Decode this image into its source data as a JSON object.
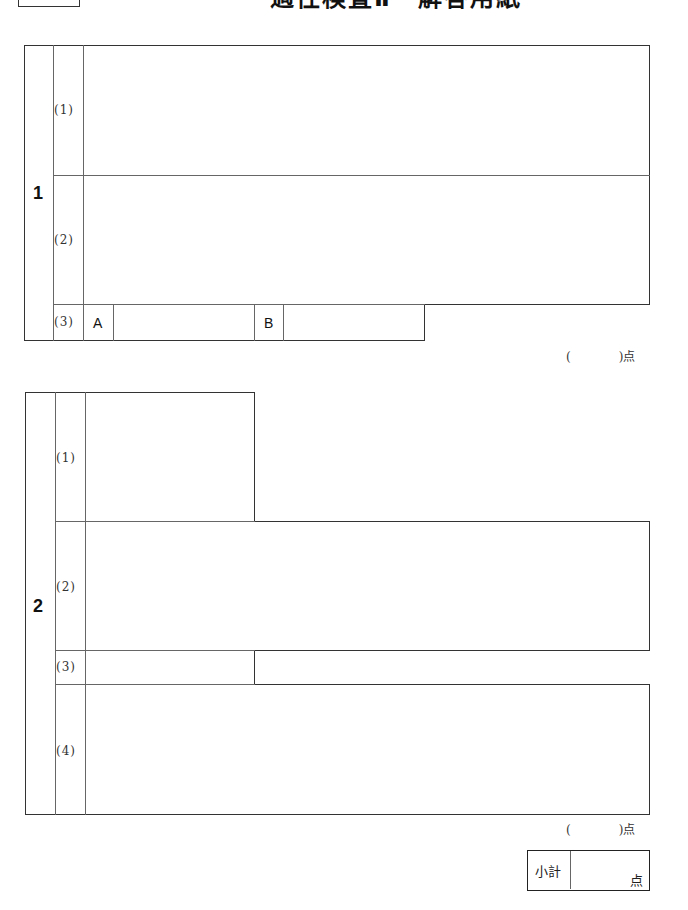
{
  "header": {
    "title": "適性検査Ⅱ　解答用紙"
  },
  "sections": [
    {
      "number": "1",
      "questions": [
        {
          "label": "(1)"
        },
        {
          "label": "(2)"
        },
        {
          "label": "(3)",
          "parts": [
            {
              "label": "A"
            },
            {
              "label": "B"
            }
          ]
        }
      ],
      "points": "(　　　　)点"
    },
    {
      "number": "2",
      "questions": [
        {
          "label": "(1)"
        },
        {
          "label": "(2)"
        },
        {
          "label": "(3)"
        },
        {
          "label": "(4)"
        }
      ],
      "points": "(　　　　)点"
    }
  ],
  "subtotal": {
    "label": "小計",
    "unit": "点"
  }
}
